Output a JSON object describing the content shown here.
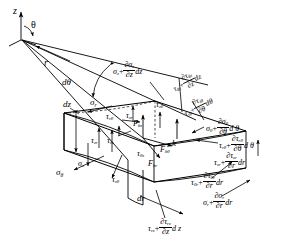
{
  "figure": {
    "type": "diagram"
  },
  "axes": {
    "z_label": "z",
    "theta_label": "θ",
    "r_label": "r",
    "dtheta_label": "dθ"
  },
  "dimensions": {
    "dz": "dz",
    "dr": "dr",
    "k": "k"
  },
  "base_stresses": {
    "sigma_r": "σ",
    "sigma_r_sub": "r",
    "sigma_theta": "σ",
    "sigma_theta_sub": "θ",
    "sigma_z": "σ",
    "sigma_z_sub": "z",
    "tau_rtheta": "τ",
    "tau_rtheta_sub": "rθ",
    "tau_ztheta": "τ",
    "tau_ztheta_sub": "zθ",
    "tau_thetaz": "τ",
    "tau_thetaz_sub": "θz",
    "tau_zr": "τ",
    "tau_zr_sub": "zr",
    "tau_rz": "τ",
    "tau_rz_sub": "rz",
    "tau_thetar": "τ",
    "tau_thetar_sub": "θr"
  },
  "body_forces": {
    "f_bz": "F",
    "f_bz_sub": "bz",
    "f_btheta": "F",
    "f_btheta_sub": "bθ",
    "f_br": "F",
    "f_br_sub": "br"
  },
  "incremented_stresses": [
    {
      "id": "sigma-z-plus",
      "base": "σ",
      "base_sub": "z",
      "num_sym": "∂σ",
      "num_sub": "z",
      "den_sym": "∂z",
      "diff": "dz"
    },
    {
      "id": "tau-thetaz-plus",
      "base": "τ",
      "base_sub": "θz",
      "num_sym": "∂τ",
      "num_sub": "θz",
      "den_sym": "∂z",
      "diff": "dz"
    },
    {
      "id": "tau-ztheta-plus",
      "base": "τ",
      "base_sub": "zθ",
      "num_sym": "∂τ",
      "num_sub": "zθ",
      "den_sym": "∂θ",
      "diff": "dθ"
    },
    {
      "id": "sigma-theta-plus",
      "base": "σ",
      "base_sub": "θ",
      "num_sym": "∂σ",
      "num_sub": "θ",
      "den_sym": "∂θ",
      "diff": "d θ"
    },
    {
      "id": "tau-rtheta-plus",
      "base": "τ",
      "base_sub": "rθ",
      "num_sym": "∂τ",
      "num_sub": "rθ",
      "den_sym": "∂θ",
      "diff": "d θ"
    },
    {
      "id": "tau-zr-plus",
      "base": "τ",
      "base_sub": "zr",
      "num_sym": "∂τ",
      "num_sub": "zr",
      "den_sym": "∂r",
      "diff": "dr"
    },
    {
      "id": "tau-thetar-plus",
      "base": "τ",
      "base_sub": "θr",
      "num_sym": "∂τ",
      "num_sub": "θr",
      "den_sym": "∂r",
      "diff": "dr"
    },
    {
      "id": "sigma-r-plus",
      "base": "σ",
      "base_sub": "r",
      "num_sym": "∂σ",
      "num_sub": "r",
      "den_sym": "∂r",
      "diff": "dr"
    },
    {
      "id": "tau-rz-plus",
      "base": "τ",
      "base_sub": "rz",
      "num_sym": "∂τ",
      "num_sub": "rz",
      "den_sym": "∂z",
      "diff": "d z"
    }
  ],
  "colors": {
    "stroke": "#000000",
    "background": "#ffffff"
  }
}
